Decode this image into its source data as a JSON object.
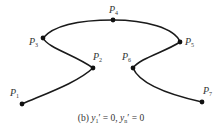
{
  "diagram": {
    "type": "spline-curves",
    "points": [
      {
        "id": "P1",
        "label": "P",
        "sub": "1",
        "x": 22,
        "y": 104
      },
      {
        "id": "P2",
        "label": "P",
        "sub": "2",
        "x": 93,
        "y": 68
      },
      {
        "id": "P3",
        "label": "P",
        "sub": "3",
        "x": 43,
        "y": 38
      },
      {
        "id": "P4",
        "label": "P",
        "sub": "4",
        "x": 113,
        "y": 20
      },
      {
        "id": "P5",
        "label": "P",
        "sub": "5",
        "x": 180,
        "y": 42
      },
      {
        "id": "P6",
        "label": "P",
        "sub": "6",
        "x": 133,
        "y": 68
      },
      {
        "id": "P7",
        "label": "P",
        "sub": "7",
        "x": 202,
        "y": 102
      }
    ],
    "caption": {
      "prefix": "(b) ",
      "y1": "y",
      "y1_sub": "1",
      "eq1": "′ = 0, ",
      "yn": "y",
      "yn_sub": "n",
      "eq2": "′ = 0"
    },
    "line_color": "#1a1a1a"
  }
}
